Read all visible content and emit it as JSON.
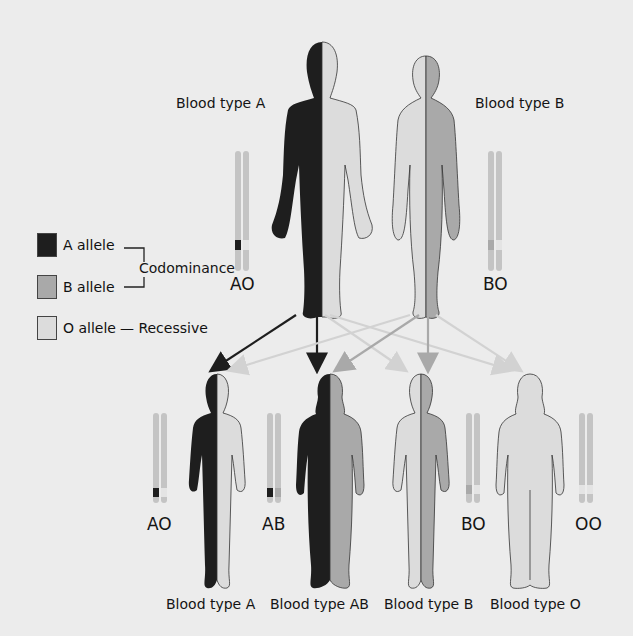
{
  "background_text": [
    "Genes are inherited from parents",
    "What if a flower trait... In the case",
    "of a plant that ... the norm les",
    "the gene is not always..."
  ],
  "parents": {
    "father": {
      "label": "Blood type A",
      "genotype": "AO"
    },
    "mother": {
      "label": "Blood type B",
      "genotype": "BO"
    }
  },
  "legend": {
    "a_allele": "A allele",
    "b_allele": "B allele",
    "o_allele": "O allele",
    "codominance": "Codominance",
    "recessive": "— Recessive"
  },
  "children": [
    {
      "label": "Blood type A",
      "genotype": "AO"
    },
    {
      "label": "Blood type AB",
      "genotype": "AB"
    },
    {
      "label": "Blood type B",
      "genotype": "BO"
    },
    {
      "label": "Blood type O",
      "genotype": "OO"
    }
  ],
  "colors": {
    "a_allele": "#1e1e1e",
    "b_allele": "#a9a9a9",
    "o_allele": "#dcdcdc",
    "background": "#ececec",
    "chromosome": "#c4c4c4"
  }
}
